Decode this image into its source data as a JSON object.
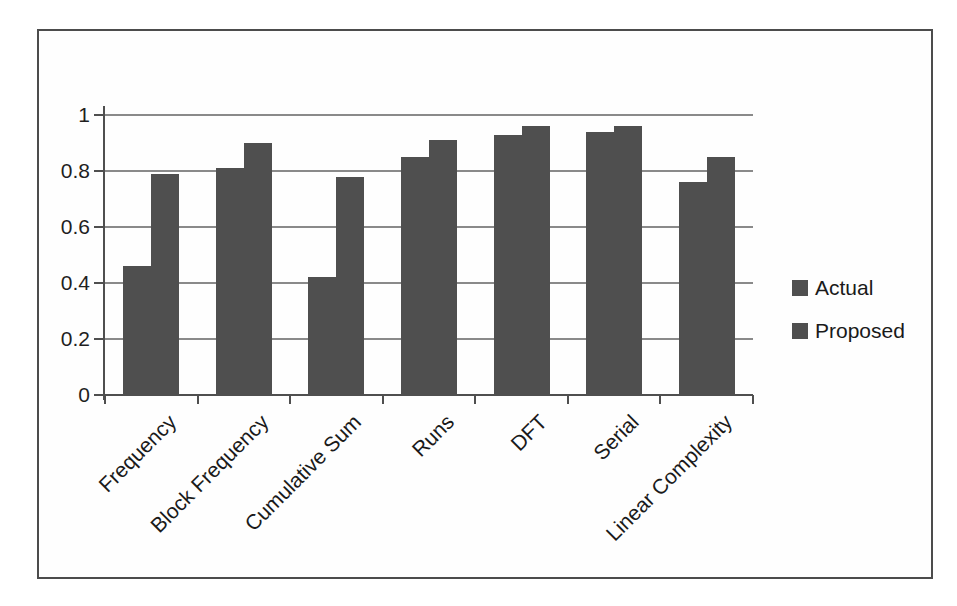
{
  "page": {
    "background": "#ffffff",
    "frame_border_color": "#4c4c4c"
  },
  "chart_data": {
    "type": "bar",
    "title": "",
    "xlabel": "",
    "ylabel": "",
    "categories": [
      "Frequency",
      "Block Frequency",
      "Cumulative Sum",
      "Runs",
      "DFT",
      "Serial",
      "Linear Complexity"
    ],
    "series": [
      {
        "name": "Actual",
        "color": "#4f4f4f",
        "values": [
          0.46,
          0.81,
          0.42,
          0.85,
          0.93,
          0.94,
          0.76
        ]
      },
      {
        "name": "Proposed",
        "color": "#4f4f4f",
        "values": [
          0.79,
          0.9,
          0.78,
          0.91,
          0.96,
          0.96,
          0.85
        ]
      }
    ],
    "ylim": [
      0,
      1
    ],
    "y_tick_labels": [
      "0",
      "0.2",
      "0.4",
      "0.6",
      "0.8",
      "1"
    ],
    "grid": true,
    "gridline_color": "#8a8a8a",
    "axis_color": "#4f4f4f",
    "text_color": "#1a1a1a",
    "legend_position": "right"
  }
}
